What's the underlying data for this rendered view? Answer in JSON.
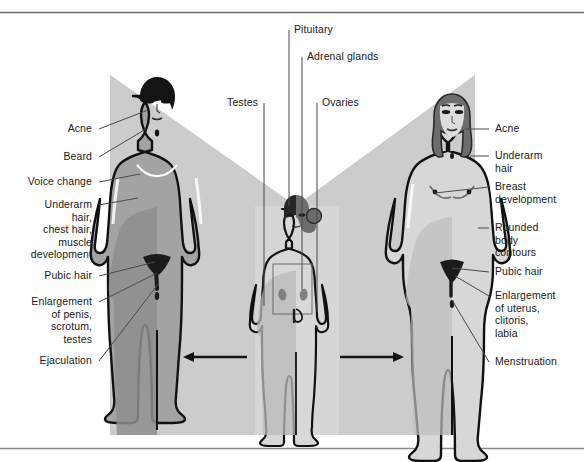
{
  "diagram": {
    "colors": {
      "background": "#ffffff",
      "panel_gray_light": "#d2d2d2",
      "panel_gray_mid": "#c3c3c3",
      "body_fill_light": "#dcdcdc",
      "body_fill_mid": "#a8a8a8",
      "body_fill_dark": "#8c8c8c",
      "hair_dark": "#1b1b1b",
      "hair_mid": "#6e6e6e",
      "outline": "#111111",
      "leader_line": "#4a4a4a",
      "text": "#1a1a1a",
      "frame_rule": "#6b6b6b"
    },
    "top_labels": [
      {
        "id": "pituitary",
        "text": "Pituitary"
      },
      {
        "id": "adrenal-glands",
        "text": "Adrenal glands"
      },
      {
        "id": "testes",
        "text": "Testes"
      },
      {
        "id": "ovaries",
        "text": "Ovaries"
      }
    ],
    "male_labels": [
      {
        "id": "acne",
        "text": "Acne"
      },
      {
        "id": "beard",
        "text": "Beard"
      },
      {
        "id": "voice-change",
        "text": "Voice change"
      },
      {
        "id": "underarm-chest-muscle",
        "text": "Underarm\nhair,\nchest hair,\nmuscle\ndevelopment"
      },
      {
        "id": "pubic-hair",
        "text": "Pubic hair"
      },
      {
        "id": "enlargement-penis",
        "text": "Enlargement\nof penis,\nscrotum,\ntestes"
      },
      {
        "id": "ejaculation",
        "text": "Ejaculation"
      }
    ],
    "female_labels": [
      {
        "id": "acne",
        "text": "Acne"
      },
      {
        "id": "underarm-hair",
        "text": "Underarm\nhair"
      },
      {
        "id": "breast-development",
        "text": "Breast\ndevelopment"
      },
      {
        "id": "rounded-body-contours",
        "text": "Rounded\nbody\ncontours"
      },
      {
        "id": "pubic-hair",
        "text": "Pubic hair"
      },
      {
        "id": "enlargement-uterus",
        "text": "Enlargement\nof uterus,\nclitoris,\nlabia"
      },
      {
        "id": "menstruation",
        "text": "Menstruation"
      }
    ],
    "figures": [
      {
        "id": "male-adult",
        "role": "adolescent male",
        "side": "left"
      },
      {
        "id": "child",
        "role": "prepubescent child (split male/female)",
        "side": "center"
      },
      {
        "id": "female-adult",
        "role": "adolescent female",
        "side": "right"
      }
    ],
    "arrows": [
      {
        "id": "arrow-left",
        "direction": "left"
      },
      {
        "id": "arrow-right",
        "direction": "right"
      }
    ]
  }
}
